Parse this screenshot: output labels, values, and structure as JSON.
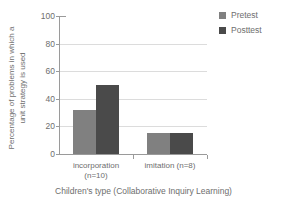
{
  "chart_data": {
    "type": "bar",
    "title": "",
    "xlabel": "Children's type (Collaborative Inquiry Learning)",
    "ylabel_line1": "Percentage of problems in which a",
    "ylabel_line2": "unit strategy is used",
    "ylabel": "Percentage of problems in which a unit strategy is used",
    "categories": [
      "incorporation (n=10)",
      "imitation (n=8)"
    ],
    "category_lines": [
      {
        "line1": "incorporation",
        "line2": "(n=10)"
      },
      {
        "line1": "imitation (n=8)",
        "line2": ""
      }
    ],
    "series": [
      {
        "name": "Pretest",
        "values": [
          32,
          15
        ],
        "color": "#808080"
      },
      {
        "name": "Posttest",
        "values": [
          50,
          15
        ],
        "color": "#4a4a4a"
      }
    ],
    "ylim": [
      0,
      100
    ],
    "yticks": [
      100,
      80,
      60,
      40,
      20,
      0
    ],
    "ytick_labels": [
      "100",
      "80",
      "60",
      "40",
      "20",
      "0"
    ],
    "grid": true,
    "grid_orientation": "horizontal",
    "legend_position": "top-right",
    "legend": [
      "Pretest",
      "Posttest"
    ]
  },
  "colors": {
    "pretest": "#808080",
    "posttest": "#4a4a4a",
    "axis": "#9a9a9a",
    "grid": "#dcdcdc",
    "text": "#6e6e6e",
    "background": "#ffffff"
  }
}
